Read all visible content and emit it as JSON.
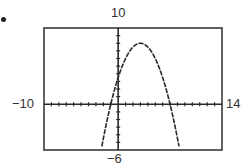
{
  "item_marker": "•",
  "window_labels": {
    "ymax": "10",
    "ymin": "−6",
    "xmin": "−10",
    "xmax": "14"
  },
  "colors": {
    "frame": "#3a3a3a",
    "axis": "#2a2a2a",
    "curve": "#2a2a2a",
    "background": "#ffffff"
  },
  "chart_data": {
    "type": "line",
    "title": "",
    "xlabel": "",
    "ylabel": "",
    "xlim": [
      -10,
      14
    ],
    "ylim": [
      -6,
      10
    ],
    "xscale": 1,
    "yscale": 1,
    "grid": false,
    "legend": null,
    "window_labels": {
      "top": "10",
      "bottom": "-6",
      "left": "-10",
      "right": "14"
    },
    "series": [
      {
        "name": "parabola (downward opening)",
        "equation_estimate": "y = -0.5x^2 + 3x + 3.5",
        "vertex": [
          3,
          8
        ],
        "x_intercepts": [
          -1,
          7
        ],
        "y_intercept": 3.5,
        "x": [
          -2.2,
          -2,
          -1.5,
          -1,
          -0.5,
          0,
          0.5,
          1,
          1.5,
          2,
          2.5,
          3,
          3.5,
          4,
          4.5,
          5,
          5.5,
          6,
          6.5,
          7,
          7.5,
          8,
          8.2
        ],
        "y": [
          -5.52,
          -4.5,
          -2.125,
          0,
          1.875,
          3.5,
          4.875,
          6,
          6.875,
          7.5,
          7.875,
          8,
          7.875,
          7.5,
          6.875,
          6,
          4.875,
          3.5,
          1.875,
          0,
          -2.125,
          -4.5,
          -5.52
        ]
      }
    ]
  }
}
